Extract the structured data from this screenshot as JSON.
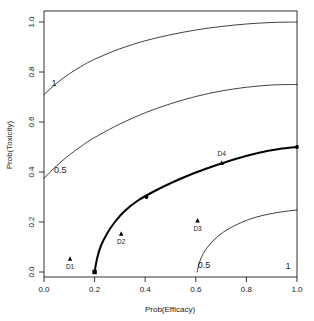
{
  "chart_data": {
    "type": "line",
    "title": "",
    "xlabel": "Prob(Efficacy)",
    "ylabel": "Prob(Toxicity)",
    "xlim": [
      0.0,
      1.0
    ],
    "ylim": [
      0.0,
      1.0
    ],
    "grid": false,
    "legend": "none",
    "xticks": [
      "0.0",
      "0.2",
      "0.4",
      "0.6",
      "0.8",
      "1.0"
    ],
    "xtick_values": [
      0.0,
      0.2,
      0.4,
      0.6,
      0.8,
      1.0
    ],
    "yticks": [
      "0.0",
      "0.2",
      "0.4",
      "0.6",
      "0.8",
      "1.0"
    ],
    "ytick_values": [
      0.0,
      0.2,
      0.4,
      0.6,
      0.8,
      1.0
    ],
    "series": [
      {
        "name": "contour-1-upper",
        "label": "1",
        "label_at": [
          0.03,
          0.745
        ],
        "style": "thin",
        "color": "#000000",
        "points": [
          [
            0.0,
            0.71
          ],
          [
            0.05,
            0.755
          ],
          [
            0.1,
            0.793
          ],
          [
            0.15,
            0.824
          ],
          [
            0.2,
            0.851
          ],
          [
            0.3,
            0.893
          ],
          [
            0.4,
            0.925
          ],
          [
            0.5,
            0.949
          ],
          [
            0.6,
            0.968
          ],
          [
            0.7,
            0.982
          ],
          [
            0.8,
            0.992
          ],
          [
            0.9,
            0.998
          ],
          [
            1.0,
            1.0
          ]
        ]
      },
      {
        "name": "contour-0.5-upper",
        "label": "0.5",
        "label_at": [
          0.04,
          0.395
        ],
        "style": "thin",
        "color": "#000000",
        "points": [
          [
            0.0,
            0.375
          ],
          [
            0.05,
            0.425
          ],
          [
            0.1,
            0.468
          ],
          [
            0.15,
            0.505
          ],
          [
            0.2,
            0.538
          ],
          [
            0.3,
            0.592
          ],
          [
            0.4,
            0.637
          ],
          [
            0.5,
            0.673
          ],
          [
            0.6,
            0.702
          ],
          [
            0.7,
            0.724
          ],
          [
            0.8,
            0.739
          ],
          [
            0.9,
            0.748
          ],
          [
            1.0,
            0.75
          ]
        ]
      },
      {
        "name": "contour-target",
        "label": "",
        "style": "thick",
        "color": "#000000",
        "points": [
          [
            0.2,
            0.0
          ],
          [
            0.21,
            0.055
          ],
          [
            0.225,
            0.105
          ],
          [
            0.25,
            0.155
          ],
          [
            0.28,
            0.2
          ],
          [
            0.32,
            0.245
          ],
          [
            0.37,
            0.285
          ],
          [
            0.43,
            0.32
          ],
          [
            0.5,
            0.355
          ],
          [
            0.58,
            0.39
          ],
          [
            0.66,
            0.42
          ],
          [
            0.75,
            0.45
          ],
          [
            0.85,
            0.477
          ],
          [
            0.93,
            0.492
          ],
          [
            1.0,
            0.5
          ]
        ]
      },
      {
        "name": "contour-0.5-lower",
        "label": "0.5",
        "label_at": [
          0.608,
          0.017
        ],
        "style": "thin",
        "color": "#000000",
        "points": [
          [
            0.605,
            0.0
          ],
          [
            0.615,
            0.04
          ],
          [
            0.63,
            0.075
          ],
          [
            0.655,
            0.11
          ],
          [
            0.69,
            0.145
          ],
          [
            0.73,
            0.173
          ],
          [
            0.78,
            0.198
          ],
          [
            0.83,
            0.217
          ],
          [
            0.89,
            0.232
          ],
          [
            0.95,
            0.242
          ],
          [
            1.0,
            0.248
          ]
        ]
      }
    ],
    "markers": [
      {
        "name": "thick-curve-start",
        "shape": "square",
        "x": 0.2,
        "y": 0.0
      },
      {
        "name": "thick-curve-mid",
        "shape": "circle",
        "x": 0.405,
        "y": 0.3
      },
      {
        "name": "thick-curve-end",
        "shape": "circle",
        "x": 1.0,
        "y": 0.5
      }
    ],
    "points": [
      {
        "label": "D1",
        "x": 0.103,
        "y": 0.052,
        "label_position": "below",
        "shape": "triangle"
      },
      {
        "label": "D2",
        "x": 0.305,
        "y": 0.152,
        "label_position": "below",
        "shape": "triangle"
      },
      {
        "label": "D3",
        "x": 0.607,
        "y": 0.205,
        "label_position": "below",
        "shape": "triangle"
      },
      {
        "label": "D4",
        "x": 0.702,
        "y": 0.435,
        "label_position": "above",
        "shape": "triangle"
      }
    ],
    "curve_labels": [
      {
        "text": "1",
        "x": 0.03,
        "y": 0.745
      },
      {
        "text": "0.5",
        "x": 0.04,
        "y": 0.395
      },
      {
        "text": "0.5",
        "x": 0.608,
        "y": 0.017
      },
      {
        "text": "1",
        "x": 0.955,
        "y": 0.012
      }
    ],
    "colors": {
      "axis": "#000000",
      "curve": "#000000",
      "background": "#ffffff"
    }
  }
}
